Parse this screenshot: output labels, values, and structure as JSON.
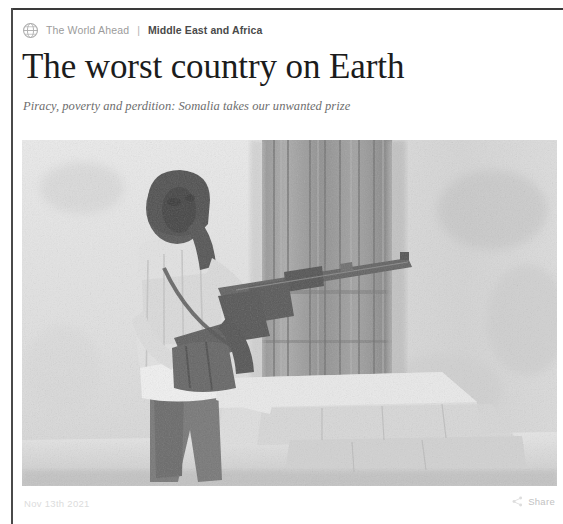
{
  "page": {
    "background_color": "#ffffff",
    "rule_color": "#3a3a3a"
  },
  "breadcrumb": {
    "globe_icon": "globe-icon",
    "section": "The World Ahead",
    "separator": "|",
    "topic": "Middle East and Africa",
    "section_color": "#9b9b9b",
    "topic_color": "#4a4a4a"
  },
  "article": {
    "headline": "The worst country on Earth",
    "standfirst": "Piracy, poverty and perdition: Somalia takes our unwanted prize",
    "headline_color": "#1c1c1c",
    "standfirst_color": "#6d6d6d"
  },
  "hero_image": {
    "alt": "Armed man in a headscarf holding a rifle, standing beside a concrete doorway and stone steps",
    "treatment": "grayscale-photograph"
  },
  "footer": {
    "date": "Nov 13th 2021",
    "share_icon": "share-icon",
    "share_label": "Share",
    "text_color": "#c9c9c9"
  }
}
